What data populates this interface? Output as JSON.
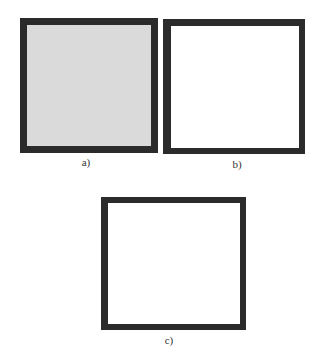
{
  "figure": {
    "panels": [
      {
        "id": "a",
        "label": "a)",
        "fill": "#dadada",
        "border": "#2b2b2b"
      },
      {
        "id": "b",
        "label": "b)",
        "fill": "#ffffff",
        "border": "#2b2b2b"
      },
      {
        "id": "c",
        "label": "c)",
        "fill": "#ffffff",
        "border": "#2b2b2b"
      }
    ]
  }
}
